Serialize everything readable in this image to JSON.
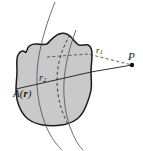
{
  "figure": {
    "background_color": "#ffffff",
    "body_fill_color": "#c9c9c9",
    "outline_color": "#1a1a1a",
    "label_color": "#1a1a1a"
  },
  "labels": {
    "area_function": {
      "text_prefix": "A(",
      "text_vector": "r",
      "text_suffix": ")",
      "full": "A(r)",
      "meaning": "vector-potential-field-label"
    },
    "r2": {
      "base": "r",
      "subscript": "2",
      "full": "r2",
      "meaning": "source-point-position-vector"
    },
    "r1": {
      "base": "r",
      "subscript": "1",
      "full": "r1",
      "meaning": "field-point-position-vector"
    },
    "point_P": {
      "text": "P",
      "meaning": "external-field-point"
    }
  },
  "geometry": {
    "point_P_marker": "filled-dot",
    "dashed_line": "r1-leader-to-P",
    "solid_line": "separation-vector-to-P",
    "hidden_edge": "dashed-curve-inside-body",
    "flow_curves_count": 2
  }
}
